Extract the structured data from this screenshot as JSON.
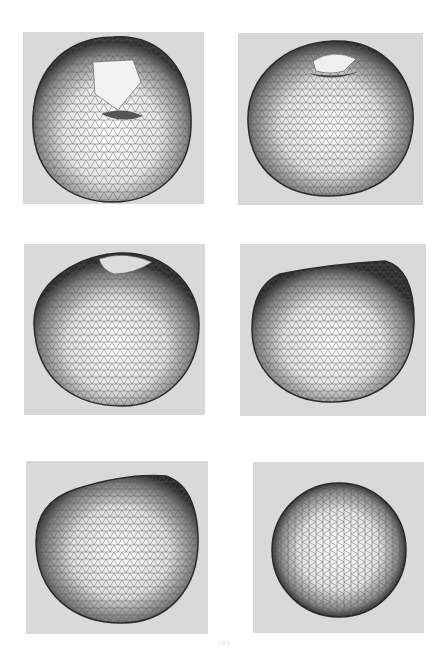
{
  "figure": {
    "layout": {
      "rows": 3,
      "columns": 2
    },
    "panel_background": "#d9d9d9",
    "mesh_color": "#3a3a3a",
    "panels": [
      {
        "id": "a",
        "name": "mesh-panel-apple-top-view",
        "shape": "apple-top",
        "box": [
          23,
          32,
          181,
          172
        ]
      },
      {
        "id": "b",
        "name": "mesh-panel-apple-tilted-view",
        "shape": "apple-tilted",
        "box": [
          238,
          33,
          185,
          172
        ]
      },
      {
        "id": "c",
        "name": "mesh-panel-apple-oblique-view",
        "shape": "apple-oblique",
        "box": [
          24,
          244,
          181,
          171
        ]
      },
      {
        "id": "d",
        "name": "mesh-panel-apple-side-view",
        "shape": "apple-side",
        "box": [
          240,
          244,
          186,
          172
        ]
      },
      {
        "id": "e",
        "name": "mesh-panel-apple-bottom-oblique-view",
        "shape": "apple-bottom",
        "box": [
          26,
          461,
          182,
          173
        ]
      },
      {
        "id": "f",
        "name": "mesh-panel-sphere-view",
        "shape": "sphere",
        "box": [
          253,
          462,
          171,
          171
        ]
      }
    ]
  },
  "page": {
    "number": "103"
  }
}
